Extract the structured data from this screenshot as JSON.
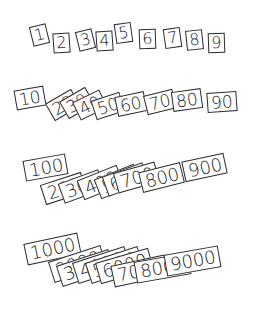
{
  "colors": {
    "card_fill": "#ffffff",
    "card_border": "#2a2a2a",
    "digit": "#1a1a1a",
    "background": "#ffffff"
  },
  "rows": [
    {
      "name": "ones",
      "cards": [
        {
          "label": "1",
          "x": 31,
          "y": 25,
          "rot": -14
        },
        {
          "label": "2",
          "x": 53,
          "y": 33,
          "rot": -4
        },
        {
          "label": "3",
          "x": 77,
          "y": 30,
          "rot": -14
        },
        {
          "label": "4",
          "x": 96,
          "y": 31,
          "rot": -4
        },
        {
          "label": "5",
          "x": 115,
          "y": 23,
          "rot": -8
        },
        {
          "label": "6",
          "x": 139,
          "y": 29,
          "rot": -2
        },
        {
          "label": "7",
          "x": 164,
          "y": 28,
          "rot": -8
        },
        {
          "label": "8",
          "x": 186,
          "y": 30,
          "rot": -6
        },
        {
          "label": "9",
          "x": 208,
          "y": 33,
          "rot": -2
        }
      ]
    },
    {
      "name": "tens",
      "cards": [
        {
          "label": "10",
          "x": 15,
          "y": 88,
          "rot": -10
        },
        {
          "label": "20",
          "x": 48,
          "y": 95,
          "rot": -30
        },
        {
          "label": "30",
          "x": 62,
          "y": 93,
          "rot": -30
        },
        {
          "label": "40",
          "x": 75,
          "y": 95,
          "rot": -26
        },
        {
          "label": "50",
          "x": 93,
          "y": 96,
          "rot": -18
        },
        {
          "label": "60",
          "x": 116,
          "y": 94,
          "rot": -12
        },
        {
          "label": "70",
          "x": 145,
          "y": 92,
          "rot": -14
        },
        {
          "label": "80",
          "x": 172,
          "y": 90,
          "rot": -8
        },
        {
          "label": "90",
          "x": 207,
          "y": 92,
          "rot": -4
        }
      ]
    },
    {
      "name": "hundreds",
      "cards": [
        {
          "label": "100",
          "x": 24,
          "y": 157,
          "rot": -10
        },
        {
          "label": "200",
          "x": 42,
          "y": 178,
          "rot": -18
        },
        {
          "label": "300",
          "x": 60,
          "y": 176,
          "rot": -20
        },
        {
          "label": "400",
          "x": 79,
          "y": 172,
          "rot": -22
        },
        {
          "label": "500",
          "x": 96,
          "y": 171,
          "rot": -22
        },
        {
          "label": "600",
          "x": 104,
          "y": 169,
          "rot": -20
        },
        {
          "label": "700",
          "x": 115,
          "y": 167,
          "rot": -16
        },
        {
          "label": "800",
          "x": 140,
          "y": 167,
          "rot": -14
        },
        {
          "label": "900",
          "x": 183,
          "y": 157,
          "rot": -12
        }
      ]
    },
    {
      "name": "thousands",
      "cards": [
        {
          "label": "1000",
          "x": 25,
          "y": 238,
          "rot": -12
        },
        {
          "label": "2000",
          "x": 50,
          "y": 253,
          "rot": -18
        },
        {
          "label": "3000",
          "x": 58,
          "y": 257,
          "rot": -18
        },
        {
          "label": "4000",
          "x": 74,
          "y": 254,
          "rot": -18
        },
        {
          "label": "5000",
          "x": 87,
          "y": 254,
          "rot": -18
        },
        {
          "label": "6000",
          "x": 97,
          "y": 255,
          "rot": -16
        },
        {
          "label": "7000",
          "x": 112,
          "y": 260,
          "rot": -12
        },
        {
          "label": "8000",
          "x": 135,
          "y": 257,
          "rot": -10
        },
        {
          "label": "9000",
          "x": 165,
          "y": 250,
          "rot": -10
        }
      ]
    }
  ]
}
